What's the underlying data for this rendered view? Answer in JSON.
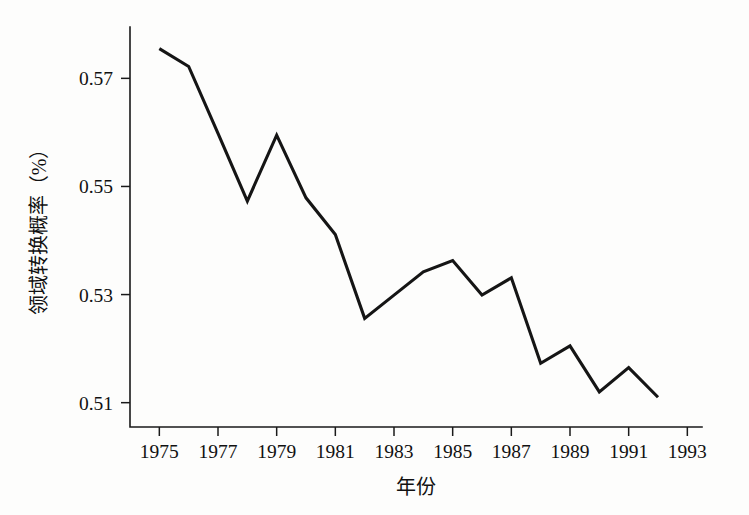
{
  "chart_data": {
    "type": "line",
    "title": "",
    "subtitle": "",
    "xlabel": "年份",
    "ylabel": "领域转换概率（%）",
    "xlim": [
      1974,
      1993.5
    ],
    "ylim": [
      0.5055,
      0.5795
    ],
    "grid": false,
    "legend": null,
    "xtick_labels": [
      "1975",
      "1977",
      "1979",
      "1981",
      "1983",
      "1985",
      "1987",
      "1989",
      "1991",
      "1993"
    ],
    "xtick_values": [
      1975,
      1977,
      1979,
      1981,
      1983,
      1985,
      1987,
      1989,
      1991,
      1993
    ],
    "ytick_labels": [
      "0.51",
      "0.53",
      "0.55",
      "0.57"
    ],
    "ytick_values": [
      0.51,
      0.53,
      0.55,
      0.57
    ],
    "x": [
      1975,
      1976,
      1977,
      1978,
      1979,
      1980,
      1981,
      1982,
      1983,
      1984,
      1985,
      1986,
      1987,
      1988,
      1989,
      1990,
      1991,
      1992
    ],
    "values": [
      0.5755,
      0.5722,
      0.5598,
      0.5473,
      0.5595,
      0.5479,
      0.5411,
      0.5256,
      0.5299,
      0.5342,
      0.5363,
      0.5299,
      0.5331,
      0.5173,
      0.5205,
      0.512,
      0.5165,
      0.511
    ],
    "series": [
      {
        "name": "领域转换概率",
        "color": "#151515",
        "values": [
          0.5755,
          0.5722,
          0.5598,
          0.5473,
          0.5595,
          0.5479,
          0.5411,
          0.5256,
          0.5299,
          0.5342,
          0.5363,
          0.5299,
          0.5331,
          0.5173,
          0.5205,
          0.512,
          0.5165,
          0.511
        ]
      }
    ]
  }
}
